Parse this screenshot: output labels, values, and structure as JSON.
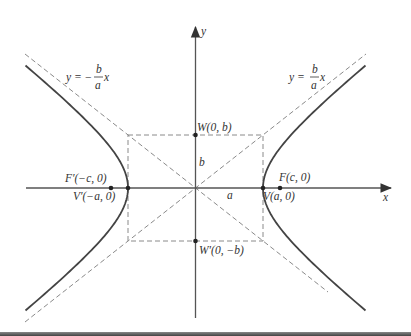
{
  "diagram": {
    "axes": {
      "x_label": "x",
      "y_label": "y"
    },
    "asymptotes": [
      {
        "id": "neg",
        "label_lhs": "y = −",
        "frac_num": "b",
        "frac_den": "a",
        "label_rhs": "x"
      },
      {
        "id": "pos",
        "label_lhs": "y = ",
        "frac_num": "b",
        "frac_den": "a",
        "label_rhs": "x"
      }
    ],
    "points": {
      "F": "F(c, 0)",
      "F_prime": "F′(−c, 0)",
      "V": "V(a, 0)",
      "V_prime": "V′(−a, 0)",
      "W": "W(0, b)",
      "W_prime": "W′(0, −b)"
    },
    "segment_labels": {
      "a": "a",
      "b": "b"
    },
    "geometry": {
      "cx": 195.5,
      "cy": 188,
      "a": 67.5,
      "b": 53,
      "c": 85
    },
    "colors": {
      "curve": "#444444",
      "axis": "#555555",
      "dashed": "#8a8a8a",
      "text": "#333333"
    }
  }
}
